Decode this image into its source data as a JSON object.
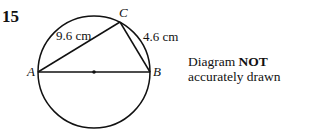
{
  "question_number": "15",
  "points": {
    "A": "A",
    "B": "B",
    "C": "C"
  },
  "lengths": {
    "AC": "9.6 cm",
    "BC": "4.6 cm"
  },
  "note": {
    "line1_prefix": "Diagram ",
    "line1_bold": "NOT",
    "line2": "accurately drawn"
  }
}
